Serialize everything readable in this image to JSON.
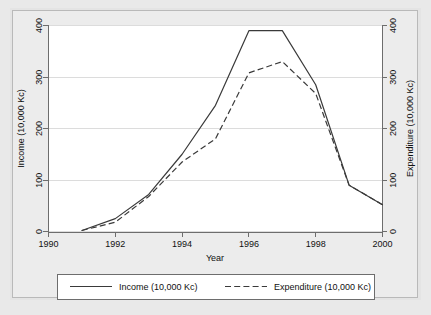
{
  "chart_data": {
    "type": "line",
    "title": "",
    "xlabel": "Year",
    "ylabel": "Income (10,000 Kc)",
    "y2label": "Expenditure (10,000 Kc)",
    "x": [
      1991,
      1992,
      1993,
      1994,
      1995,
      1996,
      1997,
      1998,
      1999,
      2000
    ],
    "xlim": [
      1990,
      2000
    ],
    "ylim": [
      0,
      400
    ],
    "y2lim": [
      0,
      400
    ],
    "xticks": [
      1990,
      1992,
      1994,
      1996,
      1998,
      2000
    ],
    "xticklabels": [
      "1990",
      "1992",
      "1994",
      "1996",
      "1998",
      "2000"
    ],
    "yticks": [
      0,
      100,
      200,
      300,
      400
    ],
    "yticklabels": [
      "0",
      "100",
      "200",
      "300",
      "400"
    ],
    "y2ticks": [
      0,
      100,
      200,
      300,
      400
    ],
    "y2ticklabels": [
      "0",
      "100",
      "200",
      "300",
      "400"
    ],
    "grid": true,
    "grid_axis": "y",
    "legend_position": "below",
    "series": [
      {
        "name": "Income (10,000 Kc)",
        "axis": "left",
        "style": "solid",
        "color": "#3a3a3a",
        "values": [
          2,
          25,
          72,
          150,
          245,
          390,
          390,
          285,
          90,
          52
        ]
      },
      {
        "name": "Expenditure (10,000 Kc)",
        "axis": "right",
        "style": "dashed",
        "color": "#3a3a3a",
        "values": [
          2,
          18,
          68,
          135,
          180,
          308,
          330,
          268,
          90,
          52
        ]
      }
    ]
  },
  "legend": {
    "entries": [
      {
        "label": "Income (10,000 Kc)",
        "style": "solid"
      },
      {
        "label": "Expenditure (10,000 Kc)",
        "style": "dashed"
      }
    ]
  }
}
